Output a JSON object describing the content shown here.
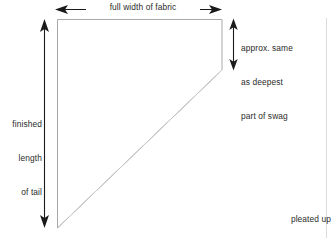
{
  "diagram": {
    "shape": {
      "name": "tail-cut-piece",
      "outline_color": "#a8a8a8",
      "diagonal_color": "#c9c9c9",
      "fill_color": "#ffffff"
    },
    "arrow_color": "#1a1a1a",
    "text_color": "#2b2b2b"
  },
  "labels": {
    "full_width": "full width of fabric",
    "finished_length_line1": "finished",
    "finished_length_line2": "length",
    "finished_length_line3": "of tail",
    "approx_line1": "approx. same",
    "approx_line2": "as deepest",
    "approx_line3": "part of swag",
    "caption_line1": "pleated up",
    "caption_line2": "geometric tail"
  }
}
